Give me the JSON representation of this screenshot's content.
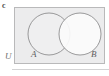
{
  "figure": {
    "part_label": "c",
    "type": "venn-diagram"
  },
  "labels": {
    "universe": "U",
    "set_a": "A",
    "set_b": "B"
  },
  "colors": {
    "page_background": "#ffffff",
    "universe_fill": "#ececed",
    "universe_stroke": "#b9b9ba",
    "circle_a_fill": "#efeff0",
    "circle_b_fill": "#fbfbfb",
    "circle_stroke": "#8f8f90",
    "text": "#5e5e5f",
    "part_label_text": "#4a4a4a",
    "rule": "#d3d3d4"
  },
  "geometry": {
    "universe_rect": {
      "x": 14,
      "y": 7,
      "width": 91,
      "height": 57
    },
    "circle_a": {
      "cx": 35,
      "cy": 27,
      "r": 21
    },
    "circle_b": {
      "cx": 66,
      "cy": 27,
      "r": 21
    }
  }
}
